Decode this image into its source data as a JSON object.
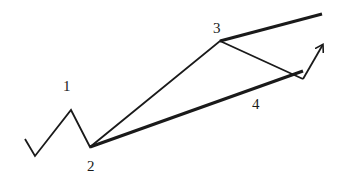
{
  "diagram": {
    "labels": [
      {
        "id": "1",
        "text": "1",
        "x": 67,
        "y": 90
      },
      {
        "id": "2",
        "text": "2",
        "x": 92,
        "y": 171
      },
      {
        "id": "3",
        "text": "3",
        "x": 218,
        "y": 32
      },
      {
        "id": "4",
        "text": "4",
        "x": 257,
        "y": 109
      }
    ],
    "wave_path": [
      [
        25,
        139
      ],
      [
        35,
        156
      ],
      [
        71,
        110
      ],
      [
        90,
        147
      ],
      [
        220,
        41
      ],
      [
        303,
        79
      ]
    ],
    "arrow": {
      "from": [
        303,
        79
      ],
      "to": [
        304,
        40
      ]
    },
    "channel_upper": {
      "from": [
        220,
        41
      ],
      "to": [
        322,
        14
      ]
    },
    "channel_lower": {
      "from": [
        90,
        147
      ],
      "to": [
        303,
        71
      ]
    },
    "line_color": "#1a1a1a"
  }
}
